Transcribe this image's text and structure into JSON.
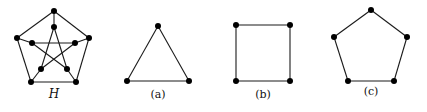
{
  "figure": {
    "background": "#ffffff",
    "edge_color": "#1a1a1a",
    "vertex_color": "#000000",
    "graphs": [
      {
        "id": "H",
        "label": "H",
        "label_italic": true,
        "label_pos": [
          54,
          98
        ],
        "description": "Petersen graph",
        "vertices": [
          [
            54,
            11
          ],
          [
            89,
            38
          ],
          [
            76,
            82
          ],
          [
            31,
            82
          ],
          [
            17,
            38
          ],
          [
            54,
            27
          ],
          [
            75,
            43
          ],
          [
            67,
            69
          ],
          [
            41,
            69
          ],
          [
            32,
            43
          ]
        ],
        "edges": [
          [
            0,
            1
          ],
          [
            1,
            2
          ],
          [
            2,
            3
          ],
          [
            3,
            4
          ],
          [
            4,
            0
          ],
          [
            0,
            5
          ],
          [
            1,
            6
          ],
          [
            2,
            7
          ],
          [
            3,
            8
          ],
          [
            4,
            9
          ],
          [
            5,
            7
          ],
          [
            7,
            9
          ],
          [
            9,
            6
          ],
          [
            6,
            8
          ],
          [
            8,
            5
          ]
        ]
      },
      {
        "id": "a",
        "label": "(a)",
        "label_italic": false,
        "label_pos": [
          158,
          98
        ],
        "description": "triangle (3-cycle)",
        "vertices": [
          [
            158,
            26
          ],
          [
            189,
            81
          ],
          [
            127,
            81
          ]
        ],
        "edges": [
          [
            0,
            1
          ],
          [
            1,
            2
          ],
          [
            2,
            0
          ]
        ]
      },
      {
        "id": "b",
        "label": "(b)",
        "label_italic": false,
        "label_pos": [
          263,
          98
        ],
        "description": "square (4-cycle)",
        "vertices": [
          [
            236,
            25
          ],
          [
            290,
            25
          ],
          [
            290,
            81
          ],
          [
            236,
            81
          ]
        ],
        "edges": [
          [
            0,
            1
          ],
          [
            1,
            2
          ],
          [
            2,
            3
          ],
          [
            3,
            0
          ]
        ]
      },
      {
        "id": "c",
        "label": "(c)",
        "label_italic": false,
        "label_pos": [
          371,
          95
        ],
        "description": "pentagon (5-cycle)",
        "vertices": [
          [
            371,
            10
          ],
          [
            407,
            37
          ],
          [
            394,
            81
          ],
          [
            348,
            81
          ],
          [
            334,
            37
          ]
        ],
        "edges": [
          [
            0,
            1
          ],
          [
            1,
            2
          ],
          [
            2,
            3
          ],
          [
            3,
            4
          ],
          [
            4,
            0
          ]
        ]
      }
    ]
  }
}
